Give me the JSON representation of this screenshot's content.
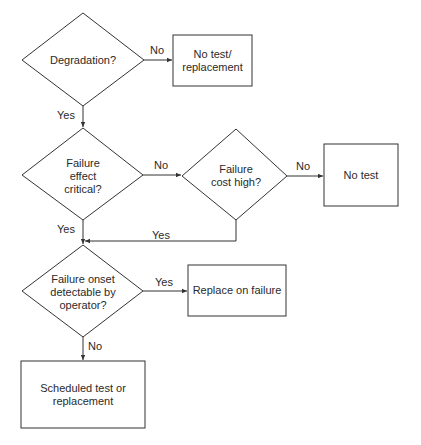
{
  "flowchart": {
    "nodes": [
      {
        "id": "d1",
        "type": "decision",
        "text": "Degradation?"
      },
      {
        "id": "b1",
        "type": "process",
        "text": "No test/\nreplacement"
      },
      {
        "id": "d2",
        "type": "decision",
        "text": "Failure\neffect\ncritical?"
      },
      {
        "id": "d3",
        "type": "decision",
        "text": "Failure\ncost high?"
      },
      {
        "id": "b2",
        "type": "process",
        "text": "No test"
      },
      {
        "id": "d4",
        "type": "decision",
        "text": "Failure onset\ndetectable by\noperator?"
      },
      {
        "id": "b3",
        "type": "process",
        "text": "Replace on failure"
      },
      {
        "id": "b4",
        "type": "process",
        "text": "Scheduled test or\nreplacement"
      }
    ],
    "edges": [
      {
        "from": "d1",
        "to": "b1",
        "label": "No"
      },
      {
        "from": "d1",
        "to": "d2",
        "label": "Yes"
      },
      {
        "from": "d2",
        "to": "d3",
        "label": "No"
      },
      {
        "from": "d3",
        "to": "b2",
        "label": "No"
      },
      {
        "from": "d2",
        "to": "d4",
        "label": "Yes"
      },
      {
        "from": "d3",
        "to": "d4",
        "label": "Yes"
      },
      {
        "from": "d4",
        "to": "b3",
        "label": "Yes"
      },
      {
        "from": "d4",
        "to": "b4",
        "label": "No"
      }
    ]
  },
  "colors": {
    "line": "#333333",
    "background": "#ffffff"
  }
}
